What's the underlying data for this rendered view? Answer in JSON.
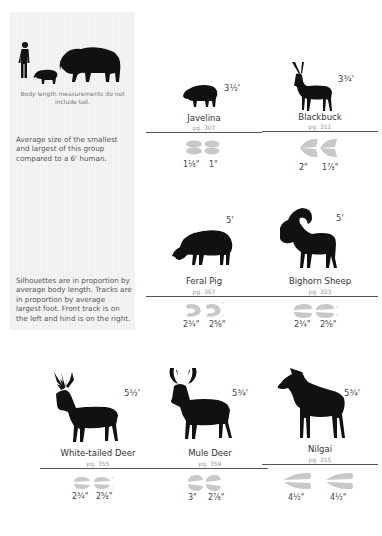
{
  "sidebar": {
    "scale_note": "Body length measurements do not include tail.",
    "scale_description": "Average size of the smallest and largest of this group compared to a 6' human.",
    "proportion_description": "Silhouettes are in proportion by average body length. Tracks are in proportion by average largest foot. Front track is on the left and hind is on the right.",
    "scale_figures": [
      "human-silhouette",
      "javelina-silhouette",
      "bison-silhouette"
    ]
  },
  "colors": {
    "silhouette": "#111111",
    "track": "#c8c8c8",
    "rule": "#555555",
    "page_ref": "#999999",
    "sidebar_bg": "#f2f2f2"
  },
  "animals": [
    {
      "name": "Javelina",
      "page": "pg. 307",
      "size": "3½'",
      "front_track": "1⅛\"",
      "hind_track": "1\""
    },
    {
      "name": "Blackbuck",
      "page": "pg. 311",
      "size": "3¾'",
      "front_track": "2\"",
      "hind_track": "1⅞\""
    },
    {
      "name": "Feral Pig",
      "page": "pg. 367",
      "size": "5'",
      "front_track": "2¾\"",
      "hind_track": "2⅝\""
    },
    {
      "name": "Bighorn Sheep",
      "page": "pg. 323",
      "size": "5'",
      "front_track": "2¾\"",
      "hind_track": "2⅝\""
    },
    {
      "name": "White-tailed Deer",
      "page": "pg. 355",
      "size": "5½'",
      "front_track": "2¾\"",
      "hind_track": "2⅝\""
    },
    {
      "name": "Mule Deer",
      "page": "pg. 359",
      "size": "5¾'",
      "front_track": "3\"",
      "hind_track": "2⅞\""
    },
    {
      "name": "Nilgai",
      "page": "pg. 315",
      "size": "5¾'",
      "front_track": "4½\"",
      "hind_track": "4½\""
    }
  ]
}
